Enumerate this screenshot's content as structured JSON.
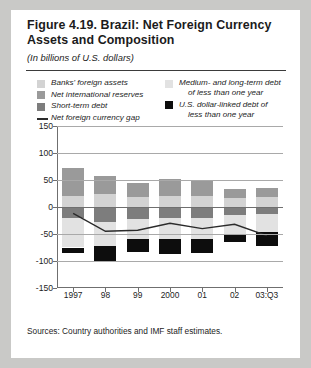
{
  "figure": {
    "title": "Figure 4.19. Brazil: Net Foreign Currency Assets and Composition",
    "subtitle": "(In billions of U.S. dollars)",
    "source": "Sources: Country authorities and IMF staff estimates."
  },
  "legend": {
    "left": [
      {
        "label": "Banks' foreign assets",
        "swatch": "#d3d3d3",
        "marker": "swatch"
      },
      {
        "label": "Net international reserves",
        "swatch": "#9a9a9a",
        "marker": "swatch"
      },
      {
        "label": "Short-term debt",
        "swatch": "#7d7d7d",
        "marker": "swatch"
      },
      {
        "label": "Net foreign currency gap",
        "swatch": "#2b2b2b",
        "marker": "line"
      }
    ],
    "right": [
      {
        "label": "Medium- and long-term debt",
        "label2": "of less than one year",
        "swatch": "#e2e2e2",
        "marker": "swatch"
      },
      {
        "label": "U.S. dollar-linked debt of",
        "label2": "less than one year",
        "swatch": "#0d0d0d",
        "marker": "swatch"
      }
    ]
  },
  "chart_data": {
    "type": "bar",
    "title": "Figure 4.19. Brazil: Net Foreign Currency Assets and Composition",
    "subtitle": "(In billions of U.S. dollars)",
    "xlabel": "",
    "ylabel": "",
    "ylim": [
      -150,
      150
    ],
    "yticks": [
      150,
      100,
      50,
      0,
      -50,
      -100,
      -150
    ],
    "ytick_labels": [
      "150",
      "100",
      "50",
      "0",
      "-50",
      "-100",
      "-150"
    ],
    "grid": true,
    "stacked": true,
    "legend_position": "top",
    "categories": [
      "1997",
      "98",
      "99",
      "2000",
      "01",
      "02",
      "03:Q3"
    ],
    "series": [
      {
        "name": "Banks' foreign assets",
        "color": "#d3d3d3",
        "stack": "positive",
        "values": [
          20,
          24,
          19,
          21,
          21,
          16,
          18
        ]
      },
      {
        "name": "Net international reserves",
        "color": "#9a9a9a",
        "stack": "positive",
        "values": [
          52,
          34,
          26,
          31,
          29,
          17,
          18
        ]
      },
      {
        "name": "Short-term debt",
        "color": "#7d7d7d",
        "stack": "negative",
        "values": [
          -20,
          -28,
          -22,
          -20,
          -21,
          -14,
          -13
        ]
      },
      {
        "name": "Medium- and long-term debt of less than one year",
        "color": "#e2e2e2",
        "stack": "negative",
        "values": [
          -55,
          -45,
          -38,
          -40,
          -38,
          -36,
          -33
        ]
      },
      {
        "name": "U.S. dollar-linked debt of less than one year",
        "color": "#0d0d0d",
        "stack": "negative",
        "values": [
          -10,
          -27,
          -23,
          -27,
          -27,
          -14,
          -27
        ]
      }
    ],
    "line_series": {
      "name": "Net foreign currency gap",
      "color": "#2b2b2b",
      "values": [
        -12,
        -45,
        -43,
        -30,
        -40,
        -32,
        -53
      ]
    }
  }
}
